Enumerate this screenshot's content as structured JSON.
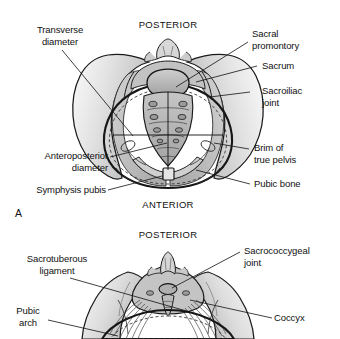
{
  "figure": {
    "panels": [
      {
        "letter": "A",
        "orientation_top": "POSTERIOR",
        "orientation_bottom": "ANTERIOR",
        "labels": [
          {
            "name": "transverse-diameter",
            "text": "Transverse\ndiameter"
          },
          {
            "name": "anteroposterior-diameter",
            "text": "Anteroposterior\ndiameter"
          },
          {
            "name": "symphysis-pubis",
            "text": "Symphysis pubis"
          },
          {
            "name": "sacral-promontory",
            "text": "Sacral\npromontory"
          },
          {
            "name": "sacrum",
            "text": "Sacrum"
          },
          {
            "name": "sacroiliac-joint",
            "text": "Sacroiliac\njoint"
          },
          {
            "name": "brim-of-true-pelvis",
            "text": "Brim of\ntrue pelvis"
          },
          {
            "name": "pubic-bone",
            "text": "Pubic bone"
          }
        ]
      },
      {
        "letter": "B",
        "orientation_top": "POSTERIOR",
        "orientation_bottom": "",
        "labels": [
          {
            "name": "sacrotuberous-ligament",
            "text": "Sacrotuberous\nligament"
          },
          {
            "name": "pubic-arch",
            "text": "Pubic\narch"
          },
          {
            "name": "sacrococcygeal-joint",
            "text": "Sacrococcygeal\njoint"
          },
          {
            "name": "coccyx",
            "text": "Coccyx"
          }
        ]
      }
    ],
    "colors": {
      "outline": "#1a1a1a",
      "bone_light": "#f0f0f0",
      "bone_mid": "#d6d6d6",
      "bone_dark": "#b3b3b3",
      "sacrum_fill": "#b8b8b8",
      "background": "#ffffff",
      "leader_line": "#1a1a1a"
    }
  },
  "panelA": {
    "orientation_top": "POSTERIOR",
    "orientation_bottom": "ANTERIOR",
    "letter": "A",
    "transverse_diameter": "Transverse\ndiameter",
    "anteroposterior_diameter": "Anteroposterior\ndiameter",
    "symphysis_pubis": "Symphysis pubis",
    "sacral_promontory": "Sacral\npromontory",
    "sacrum": "Sacrum",
    "sacroiliac_joint": "Sacroiliac\njoint",
    "brim_of_true_pelvis": "Brim of\ntrue pelvis",
    "pubic_bone": "Pubic bone"
  },
  "panelB": {
    "orientation_top": "POSTERIOR",
    "letter": "B",
    "sacrotuberous_ligament": "Sacrotuberous\nligament",
    "pubic_arch": "Pubic\narch",
    "sacrococcygeal_joint": "Sacrococcygeal\njoint",
    "coccyx": "Coccyx"
  }
}
